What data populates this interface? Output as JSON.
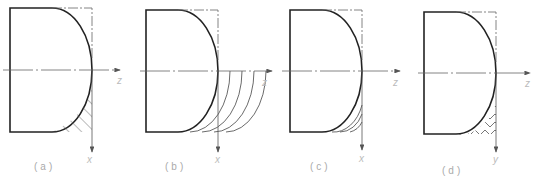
{
  "figure": {
    "panels": [
      {
        "id": "a",
        "caption": "(a)",
        "axis_h": "z",
        "axis_v": "x",
        "fill": "hatch"
      },
      {
        "id": "b",
        "caption": "(b)",
        "axis_h": "z",
        "axis_v": "x",
        "fill": "concentric-arcs"
      },
      {
        "id": "c",
        "caption": "(c)",
        "axis_h": "z",
        "axis_v": "x",
        "fill": "arcs-inside"
      },
      {
        "id": "d",
        "caption": "(d)",
        "axis_h": "z",
        "axis_v": "y",
        "fill": "chevron-hatch"
      }
    ],
    "colors": {
      "outline": "#222222",
      "thin": "#555555",
      "axis": "#666666",
      "text": "#aaaaaa"
    }
  }
}
